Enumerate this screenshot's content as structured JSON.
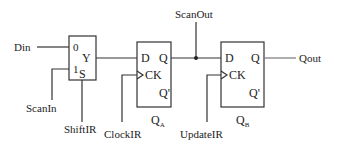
{
  "diagram": {
    "mux": {
      "input0": "0",
      "input1": "1",
      "output": "Y",
      "select": "S"
    },
    "ff_a": {
      "d": "D",
      "q": "Q",
      "ck": "CK",
      "qbar": "Q'",
      "name": "Q",
      "name_sub": "A"
    },
    "ff_b": {
      "d": "D",
      "q": "Q",
      "ck": "CK",
      "qbar": "Q'",
      "name": "Q",
      "name_sub": "B"
    },
    "signals": {
      "din": "Din",
      "scan_in": "ScanIn",
      "shift_ir": "ShiftIR",
      "clock_ir": "ClockIR",
      "scan_out": "ScanOut",
      "update_ir": "UpdateIR",
      "qout": "Qout"
    },
    "colors": {
      "line": "#333333",
      "text": "#222222",
      "background": "#ffffff"
    }
  }
}
